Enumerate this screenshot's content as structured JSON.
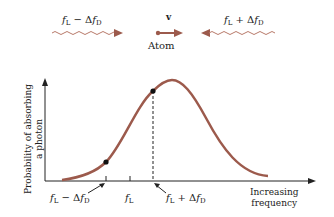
{
  "top": {
    "left_wave_label": {
      "f": "f",
      "f_sub": "L",
      "op": " − Δ",
      "df": "f",
      "df_sub": "D"
    },
    "right_wave_label": {
      "f": "f",
      "f_sub": "L",
      "op": " + Δ",
      "df": "f",
      "df_sub": "D"
    },
    "velocity_label": "v",
    "atom_label": "Atom"
  },
  "colors": {
    "curve": "#9c5a4c",
    "arrow": "#9c5a4c",
    "axis": "#222222"
  },
  "chart": {
    "y_axis_label_line1": "Probability of absorbing",
    "y_axis_label_line2": "a photon",
    "x_axis_label_line1": "Increasing",
    "x_axis_label_line2": "frequency",
    "tick_labels": {
      "left": {
        "f": "f",
        "f_sub": "L",
        "op": " − Δ",
        "df": "f",
        "df_sub": "D"
      },
      "center": {
        "f": "f",
        "f_sub": "L"
      },
      "right": {
        "f": "f",
        "f_sub": "L",
        "op": " + Δ",
        "df": "f",
        "df_sub": "D"
      }
    }
  }
}
